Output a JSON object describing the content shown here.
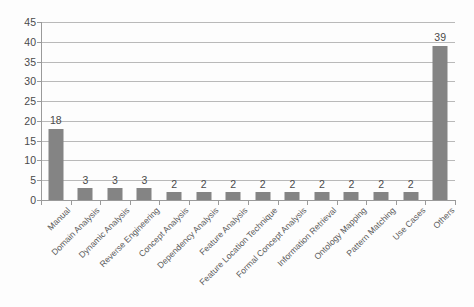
{
  "chart_data": {
    "type": "bar",
    "title": "",
    "subtitle": "",
    "xlabel": "",
    "ylabel": "",
    "ylim": [
      0,
      45
    ],
    "ytick_step": 5,
    "yticks": [
      0,
      5,
      10,
      15,
      20,
      25,
      30,
      35,
      40,
      45
    ],
    "grid": true,
    "legend": false,
    "legend_position": "none",
    "bar_color": "#848484",
    "categories": [
      "Manual",
      "Domain Analysis",
      "Dynamic Analysis",
      "Reverse Engineering",
      "Concept Analysis",
      "Dependency Analysis",
      "Feature Analysis",
      "Feature Location Technique",
      "Formal Concept Analysis",
      "Information Retrieval",
      "Ontology Mapping",
      "Pattern Matching",
      "Use Cases",
      "Others"
    ],
    "values": [
      18,
      3,
      3,
      3,
      2,
      2,
      2,
      2,
      2,
      2,
      2,
      2,
      2,
      39
    ],
    "data_labels": [
      "18",
      "3",
      "3",
      "3",
      "2",
      "2",
      "2",
      "2",
      "2",
      "2",
      "2",
      "2",
      "2",
      "39"
    ]
  }
}
